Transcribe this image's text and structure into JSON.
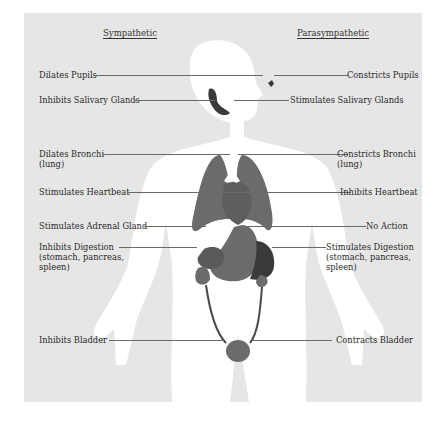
{
  "diagram": {
    "headings": {
      "left": "Sympathetic",
      "right": "Parasympathetic"
    },
    "colors": {
      "panel_background": "#e6e6e6",
      "body_silhouette": "#ffffff",
      "organ_fill": "#6b6b6b",
      "organ_dark": "#3a3a3a",
      "leader_line": "#6a6a6a",
      "text": "#2a2a2a"
    },
    "rows": [
      {
        "organ": "eye",
        "sympathetic": "Dilates Pupils",
        "parasympathetic": "Constricts Pupils"
      },
      {
        "organ": "salivary-glands",
        "sympathetic": "Inhibits Salivary Glands",
        "parasympathetic": "Stimulates Salivary Glands"
      },
      {
        "organ": "lungs",
        "sympathetic": "Dilates Bronchi\n(lung)",
        "parasympathetic": "Constricts Bronchi\n(lung)"
      },
      {
        "organ": "heart",
        "sympathetic": "Stimulates Heartbeat",
        "parasympathetic": "Inhibits Heartbeat"
      },
      {
        "organ": "adrenal-gland",
        "sympathetic": "Stimulates Adrenal Gland",
        "parasympathetic": "No Action"
      },
      {
        "organ": "digestive-organs",
        "sympathetic": "Inhibits Digestion\n(stomach, pancreas,\nspleen)",
        "parasympathetic": "Stimulates Digestion\n(stomach, pancreas,\nspleen)"
      },
      {
        "organ": "bladder",
        "sympathetic": "Inhibits Bladder",
        "parasympathetic": "Contracts Bladder"
      }
    ]
  }
}
